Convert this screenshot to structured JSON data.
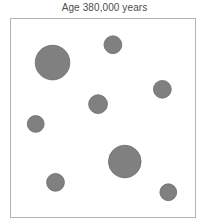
{
  "figure": {
    "title": "Age 380,000 years",
    "background_color": "#ffffff",
    "frame_color": "#b3b3b3",
    "title_color": "#4d4d4d"
  },
  "chart_data": {
    "type": "scatter",
    "title": "Age 380,000 years",
    "subtitle": "",
    "xlabel": "",
    "ylabel": "",
    "xlim": [
      0,
      186
    ],
    "ylim": [
      0,
      200
    ],
    "grid": false,
    "legend": null,
    "axis_ticks": {
      "x": [],
      "y": []
    },
    "marker_shape": "circle",
    "marker_fill": "#808080",
    "marker_stroke": "#6b6b6b",
    "series": [
      {
        "name": "density fluctuations",
        "points": [
          {
            "id": "bubble-1",
            "x": 42,
            "y": 44,
            "r": 17.5
          },
          {
            "id": "bubble-2",
            "x": 103,
            "y": 26,
            "r": 9.0
          },
          {
            "id": "bubble-3",
            "x": 153,
            "y": 71,
            "r": 9.0
          },
          {
            "id": "bubble-4",
            "x": 88,
            "y": 86,
            "r": 9.5
          },
          {
            "id": "bubble-5",
            "x": 25,
            "y": 106,
            "r": 8.5
          },
          {
            "id": "bubble-6",
            "x": 115,
            "y": 144,
            "r": 16.5
          },
          {
            "id": "bubble-7",
            "x": 45,
            "y": 165,
            "r": 9.0
          },
          {
            "id": "bubble-8",
            "x": 159,
            "y": 175,
            "r": 8.5
          }
        ]
      }
    ]
  }
}
